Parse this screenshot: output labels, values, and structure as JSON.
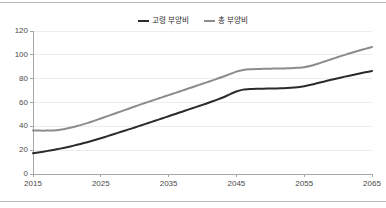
{
  "chart_data": {
    "type": "line",
    "title": "",
    "subtitle": "",
    "xlabel": "",
    "ylabel": "",
    "x": [
      2015,
      2016,
      2017,
      2018,
      2019,
      2020,
      2021,
      2022,
      2023,
      2024,
      2025,
      2026,
      2027,
      2028,
      2029,
      2030,
      2031,
      2032,
      2033,
      2034,
      2035,
      2036,
      2037,
      2038,
      2039,
      2040,
      2041,
      2042,
      2043,
      2044,
      2045,
      2046,
      2047,
      2048,
      2049,
      2050,
      2051,
      2052,
      2053,
      2054,
      2055,
      2056,
      2057,
      2058,
      2059,
      2060,
      2061,
      2062,
      2063,
      2064,
      2065
    ],
    "xlim": [
      2015,
      2065
    ],
    "ylim": [
      0,
      120
    ],
    "xticks": [
      2015,
      2025,
      2035,
      2045,
      2055,
      2065
    ],
    "xtick_labels": [
      "2015",
      "2025",
      "2035",
      "2045",
      "2055",
      "2065"
    ],
    "yticks": [
      0,
      20,
      40,
      60,
      80,
      100,
      120
    ],
    "ytick_labels": [
      "0",
      "20",
      "40",
      "60",
      "80",
      "100",
      "120"
    ],
    "grid": true,
    "grid_axis": "y",
    "legend_position": "top-center",
    "series": [
      {
        "name": "고령 부양비",
        "color": "#2b2b2b",
        "width": 2.0,
        "values": [
          17.5,
          18.3,
          19.2,
          20.2,
          21.3,
          22.5,
          23.8,
          25.2,
          26.7,
          28.3,
          30.0,
          31.8,
          33.6,
          35.4,
          37.2,
          39.0,
          40.9,
          42.8,
          44.7,
          46.6,
          48.5,
          50.4,
          52.3,
          54.2,
          56.1,
          58.0,
          60.0,
          62.0,
          64.2,
          66.8,
          69.2,
          70.8,
          71.3,
          71.5,
          71.6,
          71.7,
          71.8,
          72.0,
          72.3,
          72.8,
          73.6,
          74.9,
          76.3,
          77.7,
          79.1,
          80.4,
          81.7,
          82.9,
          84.1,
          85.3,
          86.5
        ]
      },
      {
        "name": "총 부양비",
        "color": "#8c8c8c",
        "width": 2.0,
        "values": [
          36.5,
          36.4,
          36.4,
          36.6,
          37.2,
          38.2,
          39.5,
          41.0,
          42.7,
          44.6,
          46.6,
          48.6,
          50.6,
          52.6,
          54.6,
          56.6,
          58.6,
          60.5,
          62.4,
          64.3,
          66.2,
          68.1,
          70.0,
          71.9,
          73.8,
          75.7,
          77.6,
          79.6,
          81.6,
          83.8,
          85.9,
          87.2,
          87.8,
          88.1,
          88.3,
          88.4,
          88.5,
          88.6,
          88.8,
          89.1,
          89.6,
          90.8,
          92.5,
          94.4,
          96.3,
          98.2,
          100.0,
          101.7,
          103.4,
          105.0,
          106.5
        ]
      }
    ]
  },
  "legend": {
    "entries": [
      {
        "label": "고령 부양비",
        "color": "#2b2b2b"
      },
      {
        "label": "총 부양비",
        "color": "#8c8c8c"
      }
    ]
  },
  "colors": {
    "background": "#ffffff",
    "axis": "#a6a6a6",
    "grid": "#ededed",
    "tick_text": "#4a4a4a",
    "rule": "#b8b8b8"
  }
}
